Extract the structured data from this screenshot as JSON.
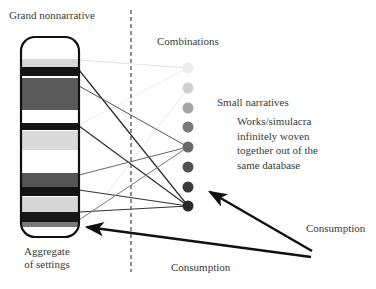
{
  "labels": {
    "grand_nonnarrative": "Grand nonnarrative",
    "combinations": "Combinations",
    "small_narratives": "Small narratives",
    "works_description": [
      "Works/simulacra",
      "infinitely woven",
      "together out of the",
      "same database"
    ],
    "aggregate_of_settings": [
      "Aggregate",
      "of settings"
    ],
    "consumption_upper": "Consumption",
    "consumption_lower": "Consumption"
  },
  "database_column": {
    "x": 21,
    "y": 37,
    "width": 58,
    "height": 200,
    "radius": 14,
    "bands": [
      {
        "y": 59,
        "h": 8,
        "color": "#d8d8d8"
      },
      {
        "y": 67,
        "h": 9,
        "color": "#141414"
      },
      {
        "y": 78,
        "h": 32,
        "color": "#5a5a5a"
      },
      {
        "y": 123,
        "h": 7,
        "color": "#161616"
      },
      {
        "y": 131,
        "h": 19,
        "color": "#dadada"
      },
      {
        "y": 173,
        "h": 14,
        "color": "#555555"
      },
      {
        "y": 187,
        "h": 9,
        "color": "#141414"
      },
      {
        "y": 197,
        "h": 15,
        "color": "#d6d6d6"
      },
      {
        "y": 212,
        "h": 10,
        "color": "#181818"
      },
      {
        "y": 222,
        "h": 5,
        "color": "#7a7a7a"
      }
    ]
  },
  "divider": {
    "x": 131,
    "y1": 10,
    "y2": 272
  },
  "combination_dots": [
    {
      "y": 68,
      "color": "#ececec"
    },
    {
      "y": 88,
      "color": "#cfcfcf"
    },
    {
      "y": 108,
      "color": "#a6a6a6"
    },
    {
      "y": 127,
      "color": "#7a7a7a"
    },
    {
      "y": 147,
      "color": "#6a6a6a"
    },
    {
      "y": 167,
      "color": "#505050"
    },
    {
      "y": 187,
      "color": "#3a3a3a"
    },
    {
      "y": 206,
      "color": "#2a2a2a"
    }
  ],
  "connections": [
    {
      "from_y": 60,
      "to_dot": 0,
      "color": "#e2e2e2",
      "width": 1
    },
    {
      "from_y": 125,
      "to_dot": 0,
      "color": "#ededed",
      "width": 1
    },
    {
      "from_y": 230,
      "to_dot": 1,
      "color": "#e8e8e8",
      "width": 1
    },
    {
      "from_y": 70,
      "to_dot": 7,
      "color": "#2a2a2a",
      "width": 1.2
    },
    {
      "from_y": 86,
      "to_dot": 4,
      "color": "#555555",
      "width": 1
    },
    {
      "from_y": 126,
      "to_dot": 7,
      "color": "#2f2f2f",
      "width": 1.2
    },
    {
      "from_y": 175,
      "to_dot": 4,
      "color": "#666666",
      "width": 1
    },
    {
      "from_y": 190,
      "to_dot": 7,
      "color": "#333333",
      "width": 1.2
    },
    {
      "from_y": 212,
      "to_dot": 7,
      "color": "#333333",
      "width": 1.2
    },
    {
      "from_y": 220,
      "to_dot": 4,
      "color": "#777777",
      "width": 1
    }
  ],
  "arrows": [
    {
      "name": "consumption-arrow-upper",
      "x1": 312,
      "y1": 251,
      "x2": 210,
      "y2": 192
    },
    {
      "name": "consumption-arrow-lower",
      "x1": 311,
      "y1": 257,
      "x2": 87,
      "y2": 227
    }
  ],
  "colors": {
    "ink": "#111111",
    "divider": "#555555",
    "text": "#3a3a3a"
  }
}
